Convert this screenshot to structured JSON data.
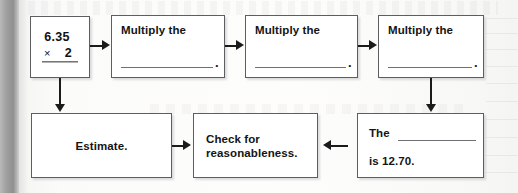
{
  "worksheet": {
    "type": "flowchart",
    "boxes": [
      {
        "id": "problem",
        "name": "math-problem-box",
        "kind": "math",
        "operand_top": "6.35",
        "operator": "×",
        "operand_bottom": "2"
      },
      {
        "id": "step1",
        "name": "multiply-step-1",
        "kind": "fill-in",
        "label": "Multiply the",
        "blank": "",
        "terminator": "."
      },
      {
        "id": "step2",
        "name": "multiply-step-2",
        "kind": "fill-in",
        "label": "Multiply the",
        "blank": "",
        "terminator": "."
      },
      {
        "id": "step3",
        "name": "multiply-step-3",
        "kind": "fill-in",
        "label": "Multiply the",
        "blank": "",
        "terminator": "."
      },
      {
        "id": "product",
        "name": "product-statement-box",
        "kind": "fill-in",
        "label_line_1": "The",
        "blank": "",
        "label_line_2": "is 12.70.",
        "value": "12.70"
      },
      {
        "id": "check",
        "name": "check-reasonableness-box",
        "kind": "text",
        "label": "Check for\nreasonableness."
      },
      {
        "id": "estimate",
        "name": "estimate-box",
        "kind": "text",
        "label": "Estimate."
      }
    ],
    "connectors": [
      {
        "name": "arrow-problem-to-step1",
        "direction": "right"
      },
      {
        "name": "arrow-step1-to-step2",
        "direction": "right"
      },
      {
        "name": "arrow-step2-to-step3",
        "direction": "right"
      },
      {
        "name": "arrow-step3-to-product",
        "direction": "down"
      },
      {
        "name": "arrow-product-to-check",
        "direction": "left"
      },
      {
        "name": "arrow-estimate-to-check",
        "direction": "right"
      },
      {
        "name": "arrow-problem-to-estimate",
        "direction": "down"
      }
    ],
    "colors": {
      "page": "#f7f7f5",
      "box_border": "#5e5e62",
      "box_fill": "#ffffff",
      "connector": "#1b1b1b",
      "text": "#141414",
      "blank_rule": "#6f6f74",
      "spine": "#9f9f9f"
    }
  }
}
